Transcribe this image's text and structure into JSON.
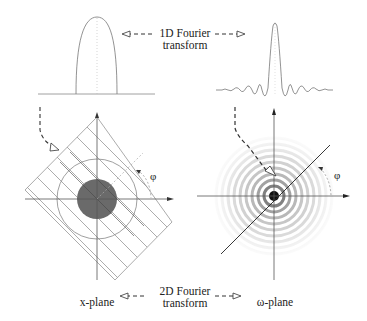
{
  "labels": {
    "top_transform_line1": "1D Fourier",
    "top_transform_line2": "transform",
    "bottom_transform_line1": "2D Fourier",
    "bottom_transform_line2": "transform",
    "left_plane": "x-plane",
    "right_plane": "ω-plane",
    "angle_left": "φ",
    "angle_right": "φ"
  },
  "colors": {
    "line": "#777777",
    "axis": "#444444",
    "disc": "#6a6a6a",
    "dashed": "#333333",
    "text": "#222222"
  },
  "panels": {
    "top_left": "1D projection profile (rounded hump)",
    "top_right": "1D Fourier transform of profile (sinc-like oscillation)",
    "bottom_left": "x-plane: dark disc with outer circle, projection hatching at angle φ",
    "bottom_right": "ω-plane: concentric rings, radial line at angle φ"
  }
}
